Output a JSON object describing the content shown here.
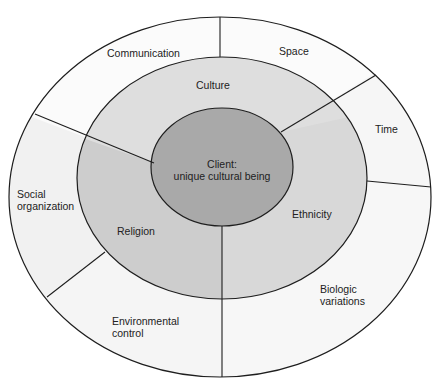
{
  "diagram": {
    "type": "concentric-ring-model",
    "center": {
      "label_line1": "Client:",
      "label_line2": "unique cultural being"
    },
    "middle_ring": [
      {
        "label": "Culture"
      },
      {
        "label": "Religion"
      },
      {
        "label": "Ethnicity"
      }
    ],
    "outer_ring": [
      {
        "label": "Communication"
      },
      {
        "label": "Space"
      },
      {
        "label": "Time"
      },
      {
        "label_line1": "Social",
        "label_line2": "organization"
      },
      {
        "label_line1": "Environmental",
        "label_line2": "control"
      },
      {
        "label_line1": "Biologic",
        "label_line2": "variations"
      }
    ],
    "colors": {
      "outer_fill": "#fbfbfb",
      "outer_fill_shaded": "#f2f2f2",
      "middle_fill": "#dedede",
      "middle_fill_shaded": "#cbcbcb",
      "inner_fill": "#a9a9a9",
      "stroke": "#1e1e1e"
    }
  }
}
